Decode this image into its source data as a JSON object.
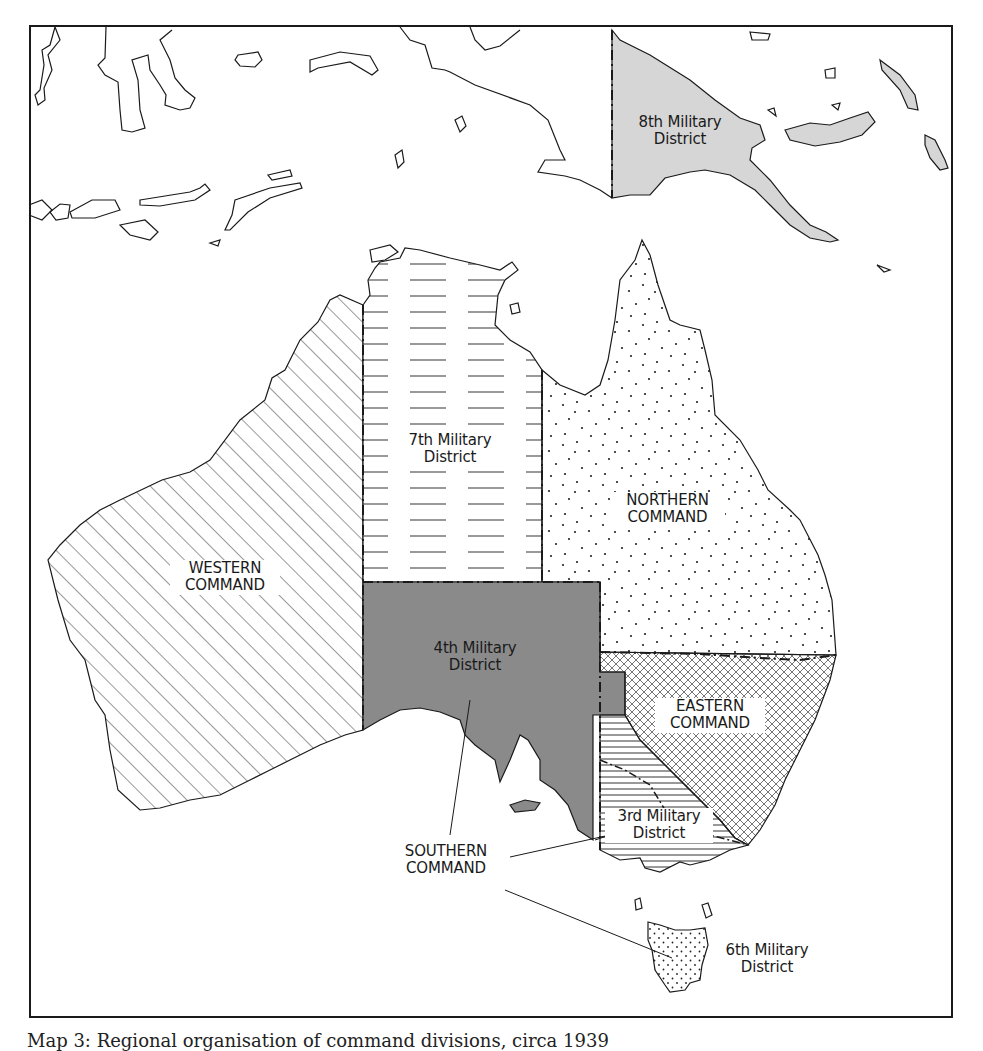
{
  "map": {
    "title_caption": "Map 3: Regional organisation of command divisions, circa 1939",
    "colors": {
      "background": "#ffffff",
      "outline": "#1a1a1a",
      "eighth_district_fill": "#d6d6d6",
      "fourth_district_fill": "#8a8a8a",
      "hatch": "#333333"
    },
    "regions": [
      {
        "id": "8th",
        "label_line1": "8th Military",
        "label_line2": "District",
        "pattern": "light-gray-fill"
      },
      {
        "id": "7th",
        "label_line1": "7th Military",
        "label_line2": "District",
        "pattern": "horizontal-dashes"
      },
      {
        "id": "western",
        "label_line1": "WESTERN",
        "label_line2": "COMMAND",
        "pattern": "diagonal-lines"
      },
      {
        "id": "northern",
        "label_line1": "NORTHERN",
        "label_line2": "COMMAND",
        "pattern": "random-dots"
      },
      {
        "id": "4th",
        "label_line1": "4th Military",
        "label_line2": "District",
        "pattern": "dark-gray-fill"
      },
      {
        "id": "eastern",
        "label_line1": "EASTERN",
        "label_line2": "COMMAND",
        "pattern": "crosshatch"
      },
      {
        "id": "3rd",
        "label_line1": "3rd Military",
        "label_line2": "District",
        "pattern": "horizontal-lines"
      },
      {
        "id": "southern",
        "label_line1": "SOUTHERN",
        "label_line2": "COMMAND",
        "pattern": "callout"
      },
      {
        "id": "6th",
        "label_line1": "6th Military",
        "label_line2": "District",
        "pattern": "regular-dots"
      }
    ]
  }
}
